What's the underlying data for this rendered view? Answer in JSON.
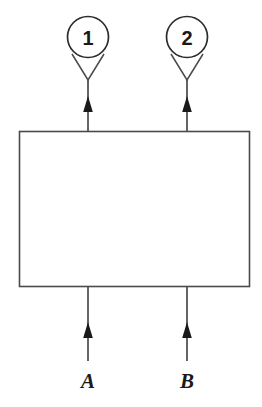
{
  "diagram": {
    "type": "block-diagram",
    "background_color": "#ffffff",
    "stroke_color": "#4a4a4a",
    "fill_color": "#ffffff",
    "arrow_color": "#1a1a1a",
    "text_color": "#1a1a1a",
    "block": {
      "name": "main-block",
      "x": 19,
      "y": 131,
      "width": 231,
      "height": 156,
      "label": ""
    },
    "outputs": [
      {
        "id": "1",
        "balloon_label": "1",
        "balloon_cx": 88,
        "balloon_cy": 37,
        "balloon_r": 20.5,
        "line_x": 88,
        "line_top": 80,
        "line_bottom": 131,
        "arrow_tip_y": 96,
        "leader_left_x": 72,
        "leader_left_y": 54,
        "leader_right_x": 104,
        "leader_right_y": 54
      },
      {
        "id": "2",
        "balloon_label": "2",
        "balloon_cx": 187,
        "balloon_cy": 37,
        "balloon_r": 20.5,
        "line_x": 187,
        "line_top": 80,
        "line_bottom": 131,
        "arrow_tip_y": 96,
        "leader_left_x": 171,
        "leader_left_y": 54,
        "leader_right_x": 203,
        "leader_right_y": 54
      }
    ],
    "inputs": [
      {
        "id": "A",
        "label": "A",
        "line_x": 88,
        "line_top": 287,
        "line_bottom": 361,
        "arrow_tip_y": 322,
        "label_x": 88,
        "label_y": 388
      },
      {
        "id": "B",
        "label": "B",
        "line_x": 187,
        "line_top": 287,
        "line_bottom": 361,
        "arrow_tip_y": 322,
        "label_x": 187,
        "label_y": 388
      }
    ]
  }
}
